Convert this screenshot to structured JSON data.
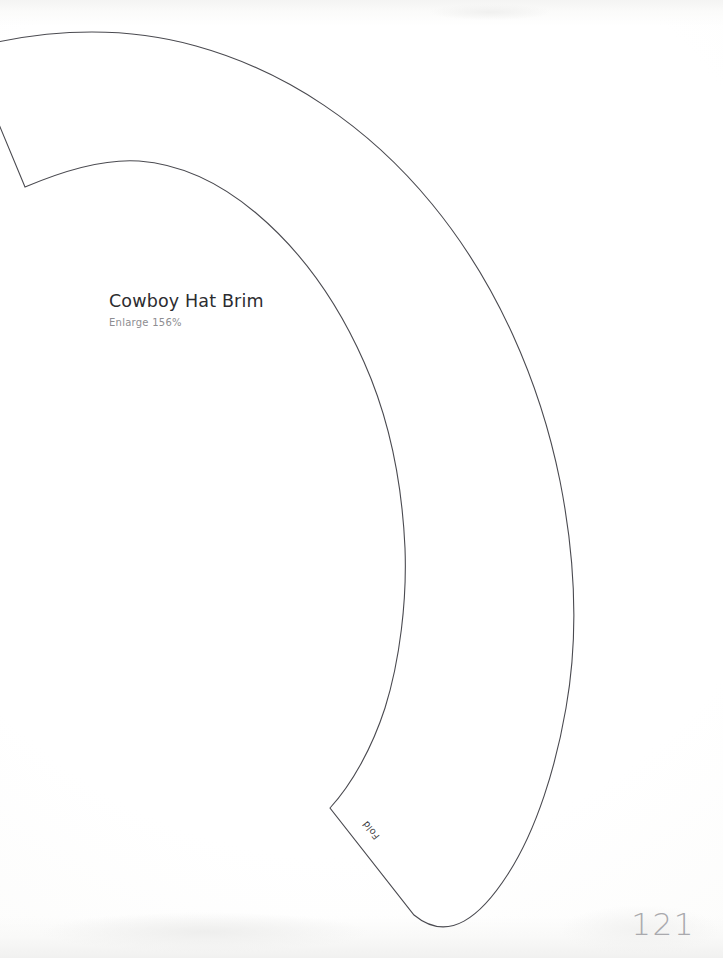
{
  "page": {
    "kind": "craft-pattern-template-page",
    "page_number": "121",
    "background_color": "#fefefe"
  },
  "pattern": {
    "title": "Cowboy Hat Brim",
    "subtitle": "Enlarge 156%",
    "fold_label": "Fold",
    "stroke_color": "#4a4a50",
    "stroke_width": 1.1,
    "fill_color": "#ffffff",
    "title_color": "#2c2c30",
    "subtitle_color": "#8d8d91",
    "page_number_color": "#a9a9ad",
    "outline_path": "M -12,44 C 60,28 128,27 196,46 C 286,71 368,126 432,204 C 497,283 540,382 560,481 C 576,562 578,640 566,708 C 556,766 537,829 508,874 C 481,916 449,944 414,915 L 330,808 C 352,784 372,748 385,708 C 400,660 407,600 405,548 C 402,482 389,418 364,362 C 337,301 300,250 256,213 C 218,181 179,164 139,161 C 110,159 72,167 25,187 L -12,98 Z",
    "outer_arc_path": "M -12,44 C 60,28 128,27 196,46 C 286,71 368,126 432,204 C 497,283 540,382 560,481 C 576,562 578,640 566,708 C 556,766 537,829 508,874 C 481,916 449,944 414,915",
    "inner_arc_path": "M 25,187 C 72,167 110,159 139,161 C 179,164 218,181 256,213 C 300,250 337,301 364,362 C 389,418 402,482 405,548 C 407,600 400,660 385,708 C 372,748 352,784 330,808",
    "left_edge_path": "M -12,98 L 25,187",
    "fold_edge_path": "M 330,808 L 414,915"
  }
}
